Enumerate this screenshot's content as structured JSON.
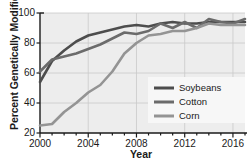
{
  "chart_data": {
    "type": "line",
    "title": "",
    "xlabel": "Year",
    "ylabel": "Percent Genetically Modified",
    "xlim": [
      2000,
      2017
    ],
    "ylim": [
      20,
      100
    ],
    "yticks": [
      20,
      40,
      60,
      80,
      100
    ],
    "ytick_labels": [
      "20",
      "40",
      "60",
      "80",
      "100"
    ],
    "xticks": [
      2000,
      2004,
      2008,
      2012,
      2016
    ],
    "xtick_labels": [
      "2000",
      "2004",
      "2008",
      "2012",
      "2016"
    ],
    "xminor_step": 1,
    "grid": true,
    "grid_color": "#c9c9c9",
    "plot_background": "#ededed",
    "legend_position": "lower-right",
    "x": [
      2000,
      2001,
      2002,
      2003,
      2004,
      2005,
      2006,
      2007,
      2008,
      2009,
      2010,
      2011,
      2012,
      2013,
      2014,
      2015,
      2016,
      2017
    ],
    "series": [
      {
        "name": "Soybeans",
        "color": "#4d4d4d",
        "values": [
          54,
          68,
          75,
          81,
          85,
          87,
          89,
          91,
          92,
          91,
          93,
          94,
          93,
          93,
          94,
          94,
          94,
          94
        ]
      },
      {
        "name": "Cotton",
        "color": "#6b6b6b",
        "values": [
          61,
          69,
          71,
          73,
          76,
          79,
          83,
          87,
          86,
          88,
          93,
          90,
          94,
          90,
          96,
          94,
          93,
          96
        ]
      },
      {
        "name": "Corn",
        "color": "#949494",
        "values": [
          25,
          26,
          34,
          40,
          47,
          52,
          61,
          73,
          80,
          85,
          86,
          88,
          88,
          90,
          93,
          92,
          92,
          92
        ]
      }
    ]
  },
  "legend": {
    "items": [
      {
        "label": "Soybeans"
      },
      {
        "label": "Cotton"
      },
      {
        "label": "Corn"
      }
    ]
  },
  "axes": {
    "x_title": "Year",
    "y_title": "Percent Genetically Modified"
  }
}
